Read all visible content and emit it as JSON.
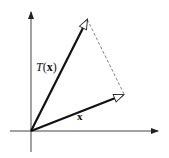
{
  "diagram": {
    "type": "linear-transformation-vectors",
    "labels": {
      "transformed_vector": {
        "prefix": "T",
        "open": "(",
        "arg": "x",
        "close": ")"
      },
      "input_vector": "x"
    },
    "geometry": {
      "origin": [
        31,
        131
      ],
      "x_axis": {
        "from": [
          10,
          131
        ],
        "to": [
          159,
          131
        ]
      },
      "y_axis": {
        "from": [
          31,
          152
        ],
        "to": [
          31,
          11
        ]
      },
      "vector_x_end": [
        124,
        94
      ],
      "vector_tx_end": [
        88,
        18
      ],
      "dashed_connector": {
        "from": [
          124,
          94
        ],
        "to": [
          87,
          18
        ]
      }
    },
    "colors": {
      "stroke": "#111111",
      "axis": "#444444",
      "dashed": "#666666",
      "background": "#ffffff"
    }
  }
}
